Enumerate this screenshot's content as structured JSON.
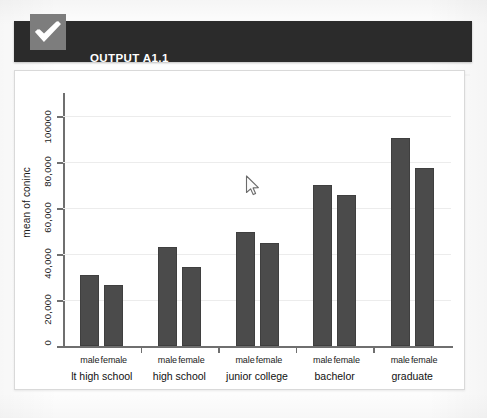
{
  "header": {
    "title": "OUTPUT A1.1",
    "checkbox_icon": "check-icon",
    "band_color": "#2b2b2b",
    "checkbox_color": "#7d7d7d"
  },
  "cursor": {
    "icon": "arrow-pointer-icon",
    "x": 248,
    "y": 180
  },
  "chart_data": {
    "type": "bar",
    "title": "",
    "xlabel": "",
    "ylabel": "mean of coninc",
    "ylim": [
      0,
      110000
    ],
    "yticks": [
      0,
      20000,
      40000,
      60000,
      80000,
      100000
    ],
    "ytick_labels": [
      "0",
      "20,000",
      "40,000",
      "60,000",
      "80,000",
      "100000"
    ],
    "grid": true,
    "legend": "none",
    "bar_color": "#4b4b4b",
    "categories": [
      "lt high school",
      "high school",
      "junior college",
      "bachelor",
      "graduate"
    ],
    "subcategories": [
      "male",
      "female"
    ],
    "series": [
      {
        "name": "male",
        "values": [
          31000,
          43000,
          49500,
          70000,
          90500
        ]
      },
      {
        "name": "female",
        "values": [
          26500,
          34500,
          45000,
          65500,
          77500
        ]
      }
    ]
  }
}
